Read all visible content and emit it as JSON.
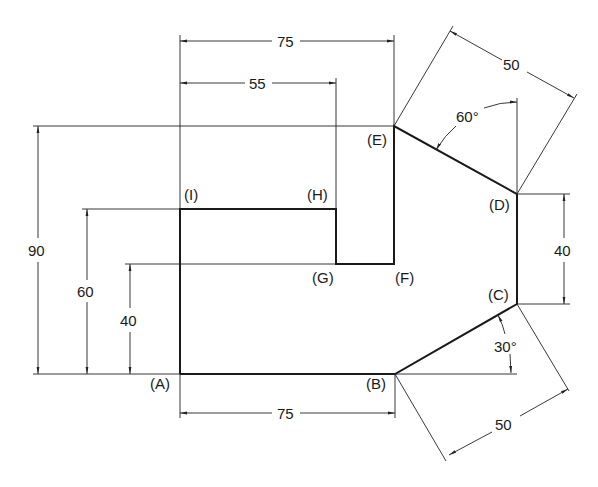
{
  "drawing": {
    "title": "Dimensioned polygon A-I",
    "points": {
      "A": "(A)",
      "B": "(B)",
      "C": "(C)",
      "D": "(D)",
      "E": "(E)",
      "F": "(F)",
      "G": "(G)",
      "H": "(H)",
      "I": "(I)"
    },
    "dimensions": {
      "top_75": "75",
      "top_55": "55",
      "bottom_75": "75",
      "left_90": "90",
      "left_60": "60",
      "left_40": "40",
      "right_40": "40",
      "slant_top_50": "50",
      "slant_bottom_50": "50",
      "angle_60": "60°",
      "angle_30": "30°"
    }
  }
}
